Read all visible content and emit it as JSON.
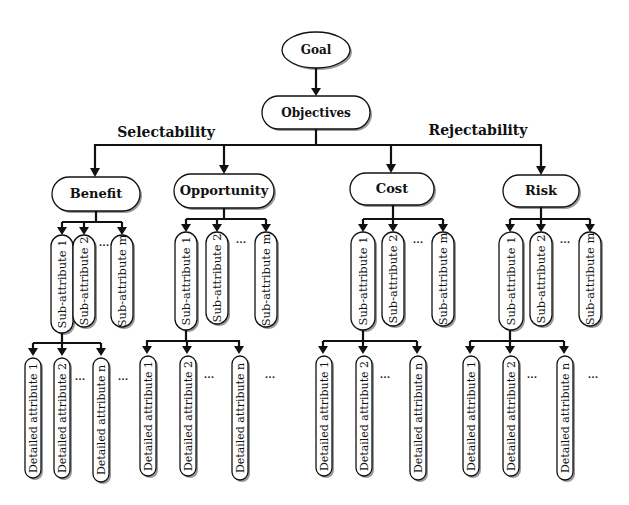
{
  "diagram": {
    "type": "hierarchy",
    "root": {
      "label": "Goal"
    },
    "objectives": {
      "label": "Objectives"
    },
    "groups": [
      {
        "label": "Selectability",
        "categories": [
          "Benefit",
          "Opportunity"
        ]
      },
      {
        "label": "Rejectability",
        "categories": [
          "Cost",
          "Risk"
        ]
      }
    ],
    "categories": [
      {
        "label": "Benefit",
        "sub_attributes": [
          "Sub-attribute 1",
          "Sub-attribute 2",
          "Sub-attribute m"
        ],
        "sub_ellipsis": "...",
        "detailed_attributes": [
          "Detailed attribute 1",
          "Detailed attribute 2",
          "Detailed attribute n"
        ],
        "detailed_ellipsis": "...",
        "trailing_ellipsis": "..."
      },
      {
        "label": "Opportunity",
        "sub_attributes": [
          "Sub-attribute 1",
          "Sub-attribute 2",
          "Sub-attribute m"
        ],
        "sub_ellipsis": "...",
        "detailed_attributes": [
          "Detailed attribute 1",
          "Detailed attribute 2",
          "Detailed attribute n"
        ],
        "detailed_ellipsis": "...",
        "trailing_ellipsis": "..."
      },
      {
        "label": "Cost",
        "sub_attributes": [
          "Sub-attribute 1",
          "Sub-attribute 2",
          "Sub-attribute m"
        ],
        "sub_ellipsis": "...",
        "detailed_attributes": [
          "Detailed attribute 1",
          "Detailed attribute 2",
          "Detailed attribute n"
        ],
        "detailed_ellipsis": "..."
      },
      {
        "label": "Risk",
        "sub_attributes": [
          "Sub-attribute 1",
          "Sub-attribute 2",
          "Sub-attribute m"
        ],
        "sub_ellipsis": "...",
        "detailed_attributes": [
          "Detailed attribute 1",
          "Detailed attribute 2",
          "Detailed attribute n"
        ],
        "detailed_ellipsis": "...",
        "trailing_ellipsis": "..."
      }
    ]
  }
}
